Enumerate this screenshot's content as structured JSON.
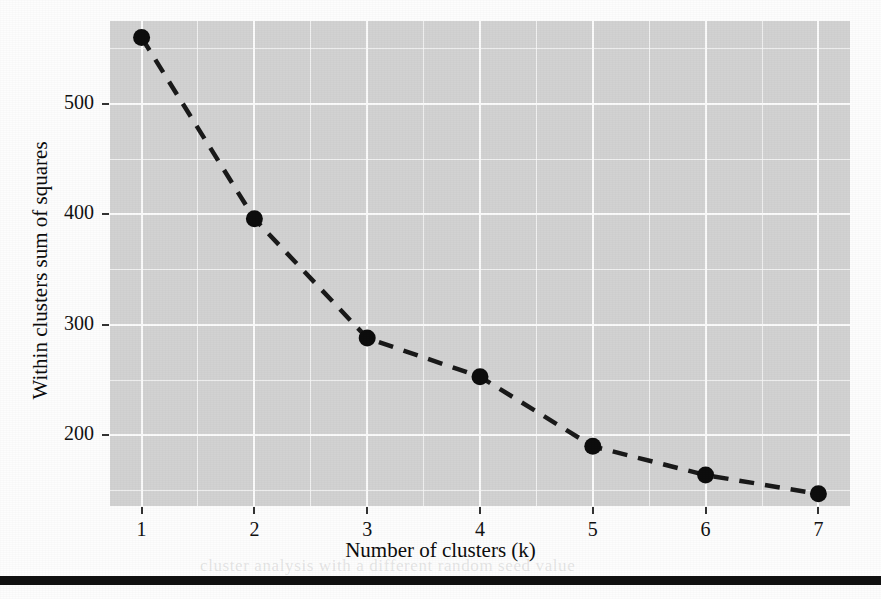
{
  "chart_data": {
    "type": "line",
    "title": "",
    "subtitle": "",
    "xlabel": "Number of clusters (k)",
    "ylabel": "Within clusters sum of squares",
    "x": [
      1,
      2,
      3,
      4,
      5,
      6,
      7
    ],
    "values": [
      560,
      396,
      288,
      253,
      190,
      164,
      147
    ],
    "series": [
      {
        "name": "Within clusters sum of squares",
        "values": [
          560,
          396,
          288,
          253,
          190,
          164,
          147
        ]
      }
    ],
    "xtick_labels": [
      "1",
      "2",
      "3",
      "4",
      "5",
      "6",
      "7"
    ],
    "ytick_labels": [
      "500",
      "400",
      "300",
      "200"
    ],
    "ytick_values": [
      500,
      400,
      300,
      200
    ],
    "xlim": [
      0.72,
      7.28
    ],
    "ylim": [
      136,
      575
    ],
    "grid": true,
    "grid_minor": true,
    "grid_minor_y_step": 50,
    "grid_minor_x_step": 0.5,
    "legend": "none",
    "line_style": "dashed",
    "marker": "circle",
    "colors": {
      "plot_background": "#d2d2d2",
      "grid_major": "#fbfbfb",
      "grid_minor": "#f4f4f4",
      "line": "#1a1a1a",
      "marker": "#0d0d0d",
      "text": "#111111",
      "page_background": "#fdfdfd",
      "rule": "#111111"
    }
  },
  "page": {
    "bleed_lines": [
      "the same as in the previous example. Thus, it returns a",
      "number of clusters is generic. Thus, it returns a cluster",
      "cluster analysis with a different random seed value"
    ]
  }
}
